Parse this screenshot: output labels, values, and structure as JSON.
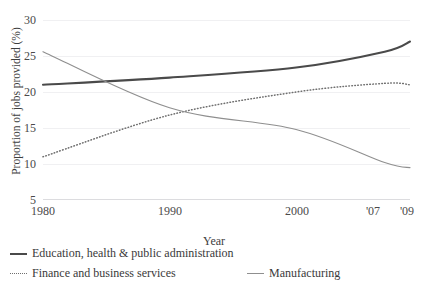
{
  "chart_data": {
    "type": "line",
    "title": "",
    "xlabel": "Year",
    "ylabel": "Proportion of jobs provided (%)",
    "x": [
      1980,
      1990,
      2000,
      2007,
      2009
    ],
    "xtick_labels": [
      "1980",
      "1990",
      "2000",
      "'07",
      "'09"
    ],
    "ytick_labels": [
      "30",
      "25",
      "20",
      "15",
      "10",
      "5"
    ],
    "yticks": [
      30,
      25,
      20,
      15,
      10,
      5
    ],
    "ylim": [
      5,
      30
    ],
    "xlim": [
      1980,
      2009
    ],
    "grid": true,
    "legend_position": "bottom",
    "series": [
      {
        "name": "Education, health & public administration",
        "style": "solid-thick",
        "color": "#4a4a4a",
        "values": [
          21.0,
          22.0,
          23.4,
          25.6,
          27.0
        ]
      },
      {
        "name": "Finance and business services",
        "style": "dotted",
        "color": "#6f6f6f",
        "values": [
          11.0,
          16.8,
          20.0,
          21.2,
          21.0
        ]
      },
      {
        "name": "Manufacturing",
        "style": "solid-thin",
        "color": "#8f8f8f",
        "values": [
          25.6,
          17.8,
          14.8,
          10.2,
          9.5
        ]
      }
    ]
  },
  "axis": {
    "y_title": "Proportion of jobs provided (%)",
    "x_title": "Year",
    "ytick_0": "30",
    "ytick_1": "25",
    "ytick_2": "20",
    "ytick_3": "15",
    "ytick_4": "10",
    "ytick_5": "5",
    "xtick_0": "1980",
    "xtick_1": "1990",
    "xtick_2": "2000",
    "xtick_3": "'07",
    "xtick_4": "'09"
  },
  "legend": {
    "item_0": "Education, health & public administration",
    "item_1": "Finance and business services",
    "item_2": "Manufacturing"
  },
  "title_remnant": ""
}
